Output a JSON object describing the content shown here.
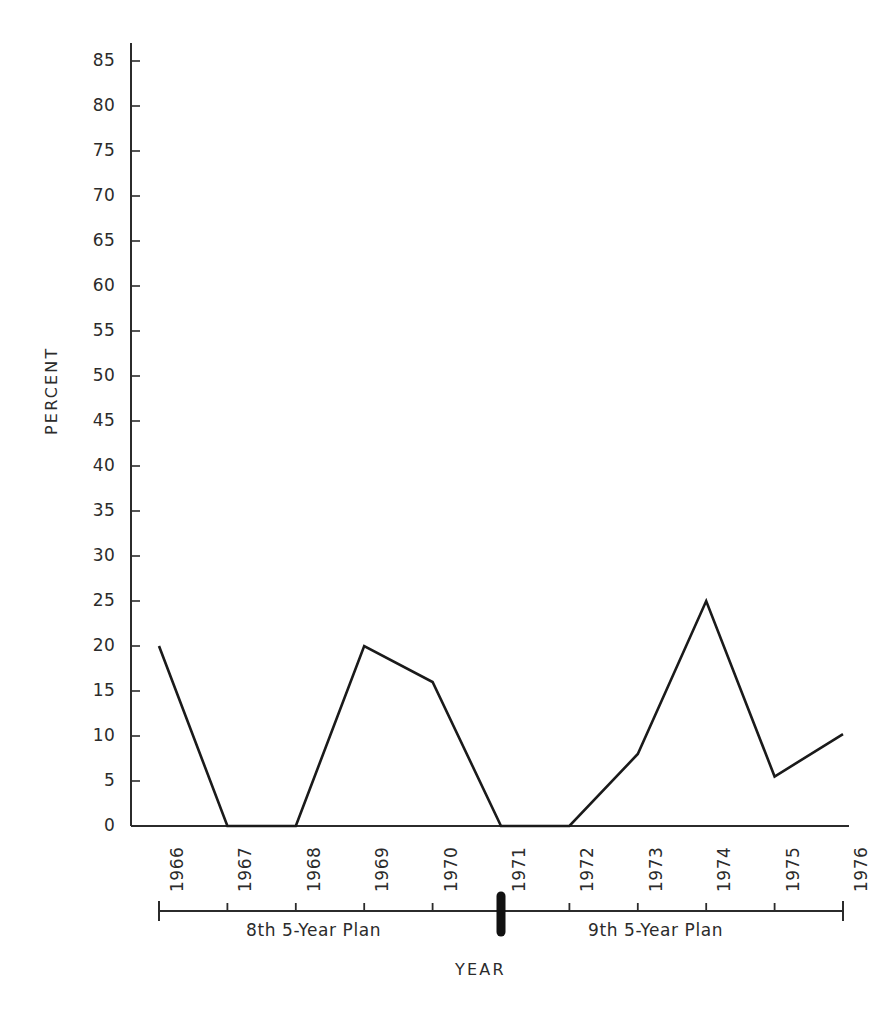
{
  "chart_data": {
    "type": "line",
    "title": "",
    "xlabel": "YEAR",
    "ylabel": "PERCENT",
    "x": [
      1966,
      1967,
      1968,
      1969,
      1970,
      1971,
      1972,
      1973,
      1974,
      1975,
      1976
    ],
    "categories": [
      "1966",
      "1967",
      "1968",
      "1969",
      "1970",
      "1971",
      "1972",
      "1973",
      "1974",
      "1975",
      "1976"
    ],
    "values": [
      20,
      0,
      0,
      20,
      16,
      0,
      0,
      8,
      25,
      5.5,
      10.2
    ],
    "series": [
      {
        "name": "percent",
        "values": [
          20,
          0,
          0,
          20,
          16,
          0,
          0,
          8,
          25,
          5.5,
          10.2
        ]
      }
    ],
    "ylim": [
      0,
      85
    ],
    "xlim": [
      1966,
      1976
    ],
    "ytick_labels": [
      "0",
      "5",
      "10",
      "15",
      "20",
      "25",
      "30",
      "35",
      "40",
      "45",
      "50",
      "55",
      "60",
      "65",
      "70",
      "75",
      "80",
      "85"
    ],
    "ytick_values": [
      0,
      5,
      10,
      15,
      20,
      25,
      30,
      35,
      40,
      45,
      50,
      55,
      60,
      65,
      70,
      75,
      80,
      85
    ],
    "grid": false,
    "legend": null,
    "legend_position": "none",
    "annotations": [
      {
        "id": "plan-8",
        "label": "8th 5-Year Plan",
        "span": [
          "1966",
          "1971"
        ]
      },
      {
        "id": "plan-9",
        "label": "9th 5-Year Plan",
        "span": [
          "1971",
          "1976"
        ]
      }
    ],
    "line_color": "#1a1a1a",
    "axis_color": "#2b2b2b",
    "background_color": "#ffffff"
  },
  "axes": {
    "y_title": "PERCENT",
    "x_title": "YEAR"
  },
  "plan_axis": {
    "divider_year": "1971",
    "left_plan": "8th 5-Year Plan",
    "right_plan": "9th 5-Year Plan"
  }
}
